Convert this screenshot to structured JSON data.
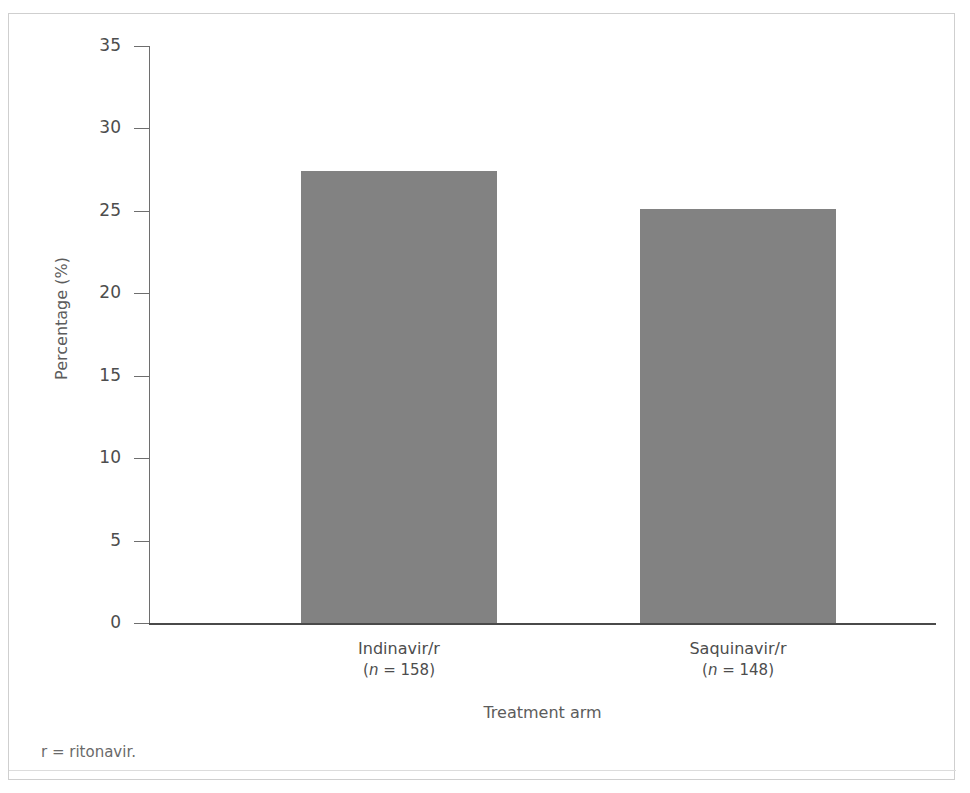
{
  "figure": {
    "footnote": "r = ritonavir."
  },
  "chart_data": {
    "type": "bar",
    "title": "",
    "xlabel": "Treatment arm",
    "ylabel": "Percentage (%)",
    "categories": [
      "Indinavir/r",
      "Saquinavir/r"
    ],
    "category_sublabels": [
      "(n = 158)",
      "(n = 148)"
    ],
    "category_counts": [
      158,
      148
    ],
    "values": [
      27.4,
      25.1
    ],
    "ylim": [
      0,
      35
    ],
    "yticks": [
      0,
      5,
      10,
      15,
      20,
      25,
      30,
      35
    ],
    "ytick_labels": [
      "0",
      "5",
      "10",
      "15",
      "20",
      "25",
      "30",
      "35"
    ],
    "grid": false,
    "legend": null,
    "bar_color": "#828282",
    "axis_color": "#6e6e6e",
    "text_color": "#4d4d4d"
  }
}
